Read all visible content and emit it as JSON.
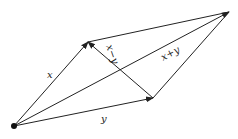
{
  "diagram": {
    "type": "vector-parallelogram",
    "points": {
      "origin": [
        14,
        126
      ],
      "x_tip": [
        88,
        42
      ],
      "y_tip": [
        153,
        98
      ],
      "sum_tip": [
        229,
        12
      ]
    },
    "labels": {
      "x": "x",
      "y": "y",
      "x_minus_y": "x−y",
      "x_plus_y": "x+y"
    },
    "colors": {
      "stroke": "#222222",
      "background": "#ffffff"
    }
  }
}
